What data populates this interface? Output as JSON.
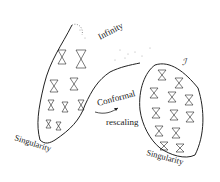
{
  "diagram": {
    "labels": {
      "infinity": "Infinity",
      "conformal": "Conformal",
      "rescaling": "rescaling",
      "singularity_left": "Singularity",
      "singularity_right": "Singularity",
      "scri": "ℐ"
    },
    "colors": {
      "ink": "#222222",
      "background": "#ffffff"
    }
  }
}
